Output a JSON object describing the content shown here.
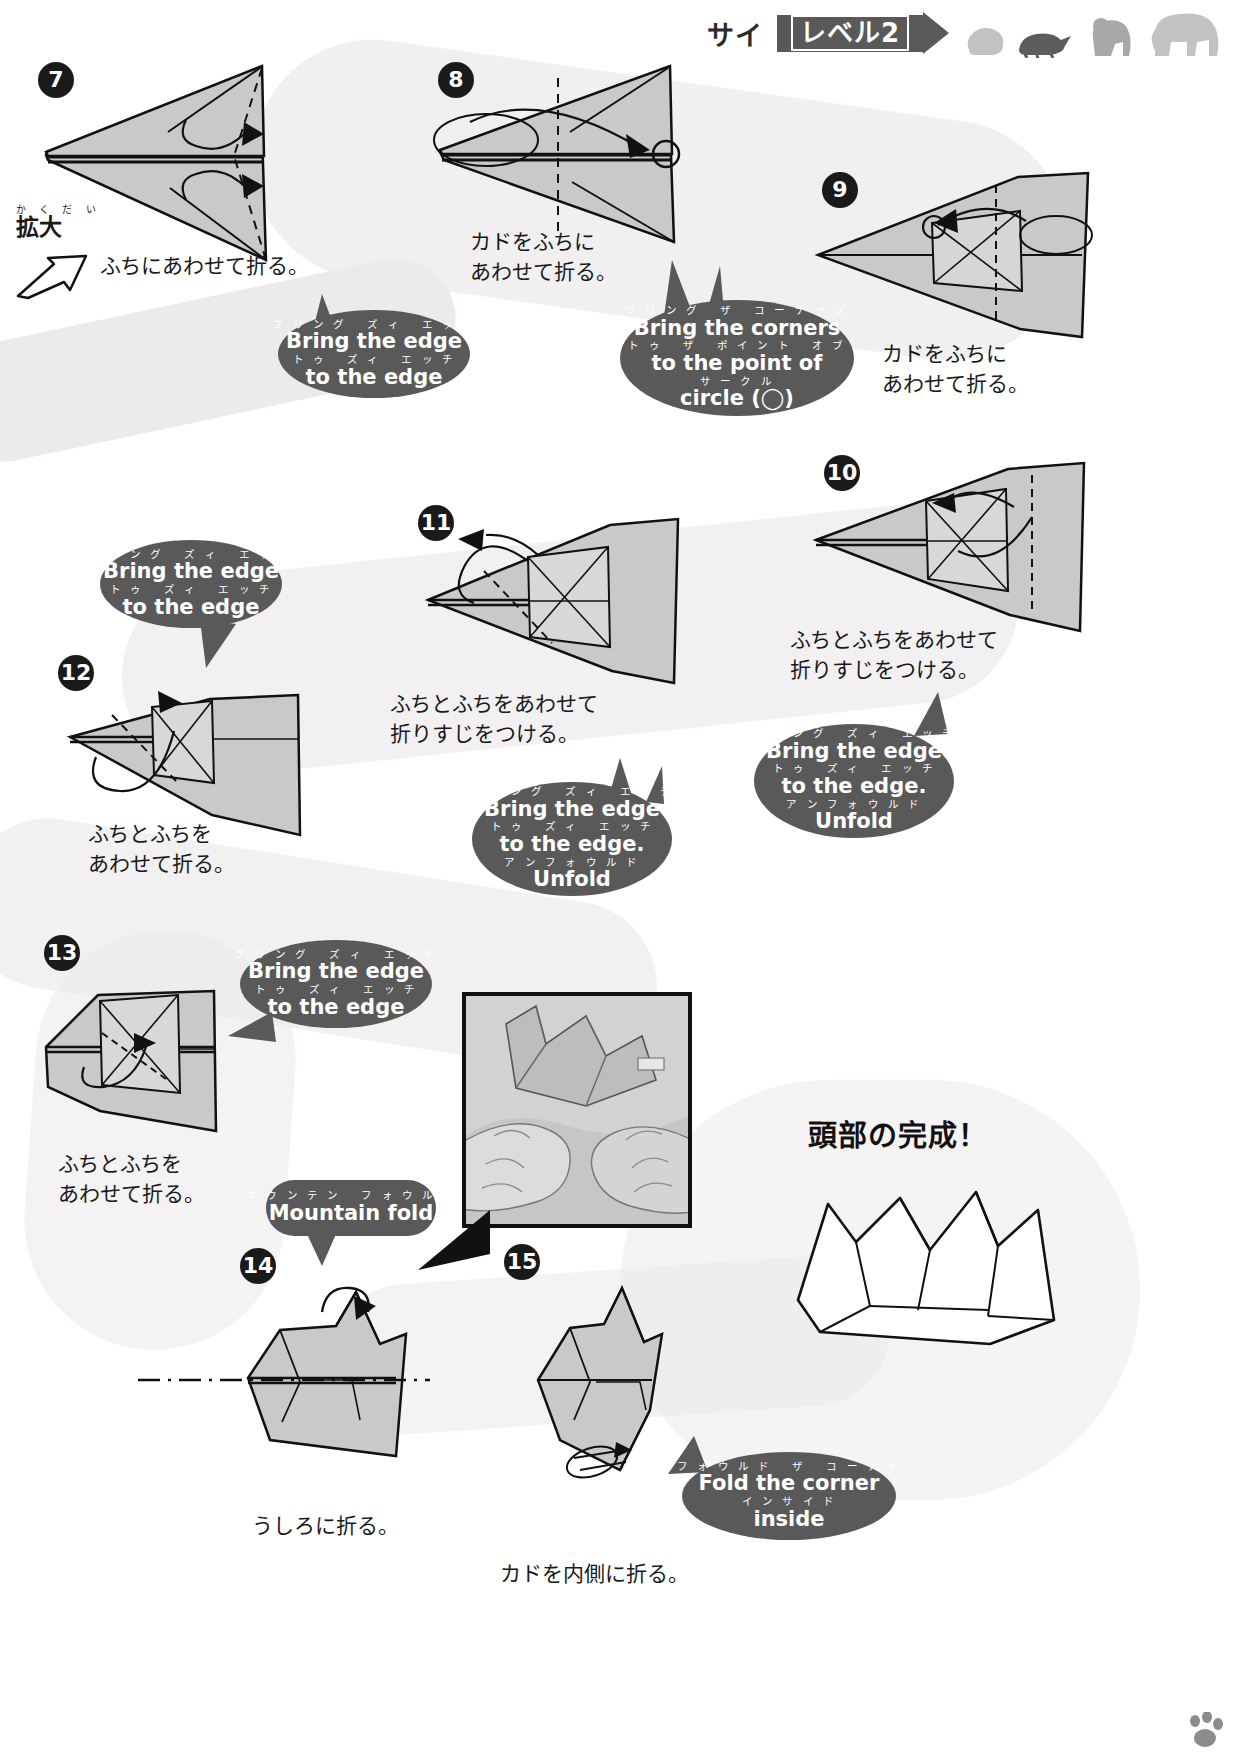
{
  "header": {
    "title_jp": "サイ",
    "level_label": "レベル2",
    "animal_icons": [
      "hippo-silhouette",
      "turtle-silhouette",
      "gorilla-silhouette",
      "elephant-silhouette"
    ]
  },
  "steps": [
    {
      "number": "7",
      "caption": "ふちにあわせて折る。",
      "enlarge_ruby": "か く だ い",
      "enlarge_label": "拡大"
    },
    {
      "number": "8",
      "caption": "カドをふちに\nあわせて折る。"
    },
    {
      "number": "9",
      "caption": "カドをふちに\nあわせて折る。"
    },
    {
      "number": "10",
      "caption": "ふちとふちをあわせて\n折りすじをつける。"
    },
    {
      "number": "11",
      "caption": "ふちとふちをあわせて\n折りすじをつける。"
    },
    {
      "number": "12",
      "caption": "ふちとふちを\nあわせて折る。"
    },
    {
      "number": "13",
      "caption": "ふちとふちを\nあわせて折る。"
    },
    {
      "number": "14",
      "caption": "うしろに折る。"
    },
    {
      "number": "15",
      "caption": "カドを内側に折る。"
    }
  ],
  "bubbles": {
    "b7": {
      "lines": [
        {
          "kana": "ブ リ ン グ   ズ ィ   エ ッ チ",
          "eng": "Bring the edge"
        },
        {
          "kana": "ト ゥ   ズ ィ   エ ッ チ",
          "eng": "to the edge"
        }
      ]
    },
    "b8": {
      "lines": [
        {
          "kana": "ブ リ ン グ   ザ   コ ー ナ ァ ズ",
          "eng": "Bring the corners"
        },
        {
          "kana": "ト ゥ   ザ   ポ イ ン ト   オ ブ",
          "eng": "to the point of"
        },
        {
          "kana": "サ ー ク ル",
          "eng": "circle (◯)"
        }
      ]
    },
    "b12": {
      "lines": [
        {
          "kana": "ブ リ ン グ   ズ ィ   エ ッ チ",
          "eng": "Bring the edge"
        },
        {
          "kana": "ト ゥ   ズ ィ   エ ッ チ",
          "eng": "to the edge"
        }
      ]
    },
    "b11": {
      "lines": [
        {
          "kana": "ブ リ ン グ   ズ ィ   エ ッ チ",
          "eng": "Bring the edge"
        },
        {
          "kana": "ト ゥ   ズ ィ   エ ッ チ",
          "eng": "to the edge."
        },
        {
          "kana": "ア ン フ ォ ウ ル ド",
          "eng": "Unfold"
        }
      ]
    },
    "b10": {
      "lines": [
        {
          "kana": "ブ リ ン グ   ズ ィ   エ ッ チ",
          "eng": "Bring the edge"
        },
        {
          "kana": "ト ゥ   ズ ィ   エ ッ チ",
          "eng": "to the edge."
        },
        {
          "kana": "ア ン フ ォ ウ ル ド",
          "eng": "Unfold"
        }
      ]
    },
    "b13": {
      "lines": [
        {
          "kana": "ブ リ ン グ   ズ ィ   エ ッ チ",
          "eng": "Bring the edge"
        },
        {
          "kana": "ト ゥ   ズ ィ   エ ッ チ",
          "eng": "to the edge"
        }
      ]
    },
    "b14": {
      "lines": [
        {
          "kana": "マ ウ ン テ ン   フ ォ ウ ル ド",
          "eng": "Mountain fold"
        }
      ]
    },
    "b15": {
      "lines": [
        {
          "kana": "フ ォ ウ ル ド   ザ   コ ー ナ ァ",
          "eng": "Fold the corner"
        },
        {
          "kana": "イ ン サ イ ド",
          "eng": "inside"
        }
      ]
    }
  },
  "final": {
    "title": "頭部の完成！"
  },
  "colors": {
    "bubble_bg": "#595959",
    "paper_front": "#c9c9c9",
    "paper_back": "#ffffff",
    "ink": "#111111",
    "ribbon": "#eceaea"
  }
}
